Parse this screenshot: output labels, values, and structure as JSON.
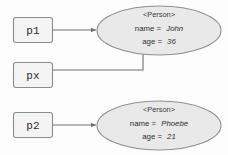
{
  "diagram": {
    "kind": "object-reference-diagram",
    "colors": {
      "background": "#fdfdfd",
      "box_fill": "#f4f4f4",
      "box_stroke": "#8c8c8c",
      "ellipse_fill": "#e9e9e9",
      "ellipse_stroke": "#8f8f8f",
      "connector": "#6f6f6f",
      "text": "#2b2b2b"
    },
    "variables": [
      {
        "id": "p1",
        "label": "p1"
      },
      {
        "id": "px",
        "label": "px"
      },
      {
        "id": "p2",
        "label": "p2"
      }
    ],
    "objects": [
      {
        "id": "person-john",
        "type_label": "<Person>",
        "attributes": [
          {
            "name": "name =",
            "value": "John"
          },
          {
            "name": "age =",
            "value": "36"
          }
        ]
      },
      {
        "id": "person-phoebe",
        "type_label": "<Person>",
        "attributes": [
          {
            "name": "name =",
            "value": "Phoebe"
          },
          {
            "name": "age =",
            "value": "21"
          }
        ]
      }
    ],
    "connectors": [
      {
        "id": "p1-to-john",
        "from": "p1",
        "to": "person-john",
        "style": "straight-arrow"
      },
      {
        "id": "px-to-john",
        "from": "px",
        "to": "person-john",
        "style": "elbow-arrow"
      },
      {
        "id": "p2-to-phoebe",
        "from": "p2",
        "to": "person-phoebe",
        "style": "straight-arrow"
      }
    ]
  }
}
